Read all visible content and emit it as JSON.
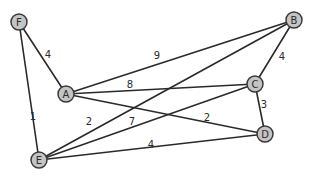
{
  "graph": {
    "title": "",
    "node_radius": 8,
    "colors": {
      "node_fill": "#c4c4c4",
      "node_stroke": "#3a3a3a",
      "edge": "#2a2a2a",
      "text": "#2b2b2b",
      "background": "#ffffff"
    },
    "nodes": [
      {
        "id": "F",
        "label": "F",
        "x": 19,
        "y": 22
      },
      {
        "id": "A",
        "label": "A",
        "x": 66,
        "y": 94
      },
      {
        "id": "B",
        "label": "B",
        "x": 294,
        "y": 20
      },
      {
        "id": "C",
        "label": "C",
        "x": 255,
        "y": 84
      },
      {
        "id": "D",
        "label": "D",
        "x": 265,
        "y": 134
      },
      {
        "id": "E",
        "label": "E",
        "x": 39,
        "y": 160
      }
    ],
    "edges": [
      {
        "from": "F",
        "to": "A",
        "weight": "4",
        "label_x": 48,
        "label_y": 54
      },
      {
        "from": "F",
        "to": "E",
        "weight": "1",
        "label_x": 33,
        "label_y": 116
      },
      {
        "from": "A",
        "to": "B",
        "weight": "9",
        "label_x": 157,
        "label_y": 55
      },
      {
        "from": "A",
        "to": "C",
        "weight": "8",
        "label_x": 130,
        "label_y": 84
      },
      {
        "from": "A",
        "to": "D",
        "weight": "2",
        "label_x": 207,
        "label_y": 117
      },
      {
        "from": "B",
        "to": "C",
        "weight": "4",
        "label_x": 282,
        "label_y": 56
      },
      {
        "from": "C",
        "to": "D",
        "weight": "3",
        "label_x": 264,
        "label_y": 104
      },
      {
        "from": "E",
        "to": "B",
        "weight": "2",
        "label_x": 89,
        "label_y": 121
      },
      {
        "from": "E",
        "to": "C",
        "weight": "7",
        "label_x": 132,
        "label_y": 121
      },
      {
        "from": "E",
        "to": "D",
        "weight": "4",
        "label_x": 151,
        "label_y": 144
      }
    ]
  }
}
